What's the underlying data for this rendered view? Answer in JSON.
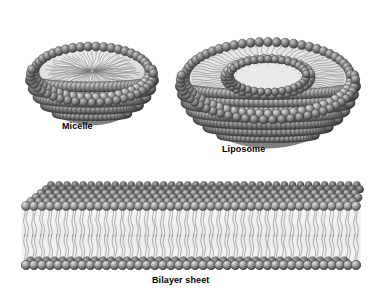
{
  "figure": {
    "background_color": "#ffffff",
    "width": 372,
    "height": 291,
    "style": "grayscale 3D scientific illustration"
  },
  "palette": {
    "head_base": "#7d7d7d",
    "head_light": "#d8d8d8",
    "head_dark": "#4a4a4a",
    "head_outline": "#3c3c3c",
    "tail_color": "#6f6f6f",
    "tail_field": "#efefef",
    "interior_fill": "#f2f2f2",
    "label_color": "#000000"
  },
  "structures": [
    {
      "id": "micelle",
      "label": "Micelle",
      "description": "Cut-away hemispherical micelle: single layer of polar head groups on the outside with hydrophobic tails radiating inward to a common center",
      "center_x": 92,
      "center_y": 72,
      "rim_radius_x": 62,
      "rim_radius_y": 27,
      "rim_head_count": 46,
      "interior_tail_count": 64,
      "body_rows": 6,
      "label_x": 62,
      "label_y": 121
    },
    {
      "id": "liposome",
      "label": "Liposome",
      "description": "Cut-away spherical liposome: lipid bilayer vesicle with an outer leaflet rim, an inner leaflet ring and an aqueous cavity in the middle",
      "center_x": 268,
      "center_y": 78,
      "outer_radius_x": 88,
      "outer_radius_y": 38,
      "inner_radius_x": 40,
      "inner_radius_y": 17,
      "outer_head_count": 60,
      "inner_head_count": 34,
      "bilayer_tail_count": 72,
      "body_rows": 8,
      "label_x": 222,
      "label_y": 144
    },
    {
      "id": "bilayer-sheet",
      "label": "Bilayer sheet",
      "description": "Planar lipid bilayer slab drawn in perspective: two opposed leaflets of head groups with wavy hydrocarbon tails meeting in the middle",
      "front_left_x": 26,
      "front_right_x": 356,
      "top_head_y": 206,
      "bottom_head_y": 265,
      "depth_rows": 5,
      "front_head_count": 42,
      "tail_pairs": 42,
      "label_x": 152,
      "label_y": 275
    }
  ],
  "labels": {
    "micelle": "Micelle",
    "liposome": "Liposome",
    "bilayer": "Bilayer sheet"
  }
}
